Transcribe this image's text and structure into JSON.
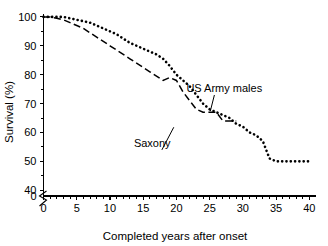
{
  "chart_data": {
    "type": "line",
    "title": "",
    "xlabel": "Completed years after onset",
    "ylabel": "Survival (%)",
    "xlim": [
      0,
      41
    ],
    "ylim": [
      38,
      101
    ],
    "grid": false,
    "legend_position": "inline-annotations",
    "axis_break": {
      "axis": "y",
      "label_below_break": "0",
      "note": "y-axis broken between 0 and 40"
    },
    "x_ticks_major": [
      0,
      5,
      10,
      15,
      20,
      25,
      30,
      35,
      40
    ],
    "x_tick_labels": [
      "0",
      "5",
      "10",
      "15",
      "20",
      "25",
      "30",
      "35",
      "40"
    ],
    "x_ticks_minor": [
      1,
      2,
      3,
      4,
      6,
      7,
      8,
      9,
      11,
      12,
      13,
      14,
      16,
      17,
      18,
      19,
      21,
      22,
      23,
      24,
      26,
      27,
      28,
      29,
      31,
      32,
      33,
      34,
      36,
      37,
      38,
      39
    ],
    "y_ticks_major": [
      40,
      50,
      60,
      70,
      80,
      90,
      100
    ],
    "y_tick_labels": [
      "40",
      "50",
      "60",
      "70",
      "80",
      "90",
      "100"
    ],
    "y_ticks_minor": [
      45,
      55,
      65,
      75,
      85,
      95
    ],
    "y_zero_label": "0",
    "series": [
      {
        "name": "Saxony",
        "style": "dotted",
        "x": [
          0,
          1,
          2,
          3,
          4,
          5,
          6,
          7,
          8,
          9,
          10,
          11,
          12,
          13,
          14,
          15,
          16,
          17,
          18,
          19,
          20,
          21,
          22,
          23,
          24,
          25,
          26,
          27,
          28,
          29,
          30,
          31,
          32,
          33,
          34,
          35,
          36,
          37,
          38,
          39,
          40
        ],
        "values": [
          100,
          100,
          100,
          100,
          99.5,
          99,
          98.5,
          98,
          97,
          96,
          95,
          94,
          92.5,
          91,
          90,
          89,
          88,
          87,
          85.5,
          83,
          80,
          78,
          76,
          73,
          70,
          68,
          67,
          66,
          65,
          63,
          62,
          60,
          59,
          57,
          51,
          50,
          50,
          50,
          50,
          50,
          50
        ]
      },
      {
        "name": "US Army males",
        "style": "dashed",
        "x": [
          0,
          1,
          2,
          3,
          4,
          5,
          6,
          7,
          8,
          9,
          10,
          11,
          12,
          13,
          14,
          15,
          16,
          17,
          18,
          19,
          20,
          21,
          22,
          23,
          24,
          25,
          26,
          27,
          28,
          29
        ],
        "values": [
          100,
          100,
          99.5,
          99,
          98,
          97,
          96,
          94.5,
          93,
          91.5,
          90,
          88.5,
          87,
          85.5,
          84,
          82.5,
          81,
          79.5,
          78,
          79,
          78,
          74,
          71,
          68,
          67,
          67,
          67,
          64,
          64,
          64
        ]
      }
    ],
    "annotations": [
      {
        "text": "US Army males",
        "target_series": "US Army males",
        "x_text": 21.5,
        "y_text": 74.0,
        "x_point": 25.1,
        "y_point": 67.4
      },
      {
        "text": "Saxony",
        "target_series": "Saxony",
        "x_text": 13.6,
        "y_text": 55.0,
        "x_point": 19.6,
        "y_point": 61.8
      }
    ]
  }
}
